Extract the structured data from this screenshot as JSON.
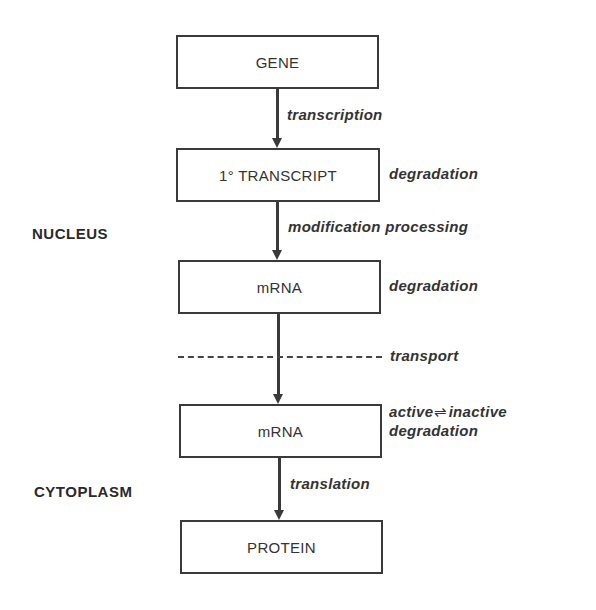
{
  "diagram": {
    "title": "",
    "regions": {
      "nucleus": "NUCLEUS",
      "cytoplasm": "CYTOPLASM"
    },
    "boxes": [
      {
        "id": "gene",
        "label": "GENE"
      },
      {
        "id": "primary-transcript",
        "label": "1° TRANSCRIPT"
      },
      {
        "id": "mrna-nuclear",
        "label": "mRNA"
      },
      {
        "id": "mrna-cytoplasmic",
        "label": "mRNA"
      },
      {
        "id": "protein",
        "label": "PROTEIN"
      }
    ],
    "edges": [
      {
        "from": "gene",
        "to": "primary-transcript",
        "label": "transcription"
      },
      {
        "from": "primary-transcript",
        "to": "mrna-nuclear",
        "label": "modification processing"
      },
      {
        "from": "mrna-nuclear",
        "to": "mrna-cytoplasmic",
        "label": "transport"
      },
      {
        "from": "mrna-cytoplasmic",
        "to": "protein",
        "label": "translation"
      }
    ],
    "side_notes": {
      "primary_transcript": "degradation",
      "mrna_nuclear": "degradation",
      "mrna_cytoplasmic_line1_left": "active",
      "mrna_cytoplasmic_line1_arrow": "⇌",
      "mrna_cytoplasmic_line1_right": "inactive",
      "mrna_cytoplasmic_line2": "degradation"
    }
  }
}
